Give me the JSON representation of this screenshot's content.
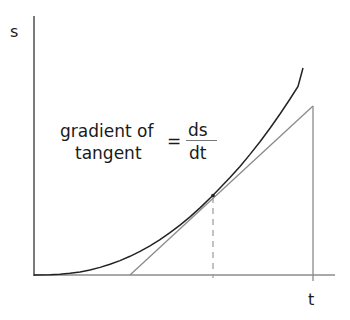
{
  "diagram": {
    "y_axis_label": "s",
    "x_axis_label": "t",
    "annotation": {
      "line1": "gradient of",
      "line2": "tangent",
      "equals": "=",
      "numerator": "ds",
      "denominator": "dt"
    },
    "elements": {
      "curve": "distance-time curve (increasing gradient)",
      "tangent": "tangent line touching the curve at a point",
      "dashed_drop": "dashed vertical line from point of tangency to t axis",
      "vertical_side": "vertical line forming triangle with tangent and t axis"
    },
    "colors": {
      "axis": "#333333",
      "curve": "#222222",
      "tangent": "#8a8a8a",
      "text": "#1a1a1a"
    }
  }
}
